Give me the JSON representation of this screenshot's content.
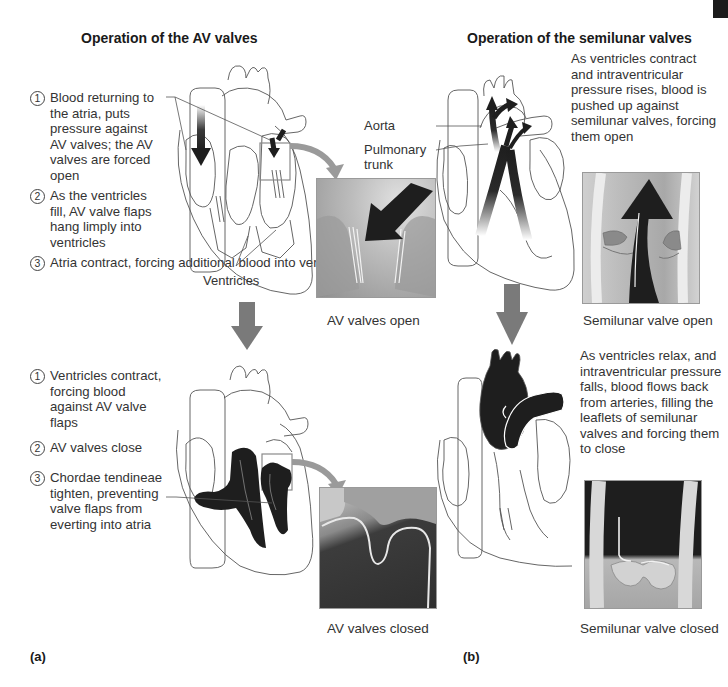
{
  "figure": {
    "corner_tab_color": "#1b1b1b",
    "arrow_color": "#7a7a7a",
    "blood_color": "#1e1e1e"
  },
  "panel_a": {
    "title": "Operation of the AV valves",
    "part_label": "(a)",
    "open_steps": [
      {
        "num": "1",
        "text": "Blood returning to the atria, puts pressure against AV valves; the AV valves are forced open"
      },
      {
        "num": "2",
        "text": "As the ventricles fill, AV valve flaps hang limply into ventricles"
      },
      {
        "num": "3",
        "text": "Atria contract, forcing additional blood into ventricles"
      }
    ],
    "ventricles_label": "Ventricles",
    "open_caption": "AV valves open",
    "closed_steps": [
      {
        "num": "1",
        "text": "Ventricles contract, forcing blood against AV valve flaps"
      },
      {
        "num": "2",
        "text": "AV valves close"
      },
      {
        "num": "3",
        "text": "Chordae tendineae tighten, preventing valve flaps from everting into atria"
      }
    ],
    "closed_caption": "AV valves closed"
  },
  "panel_b": {
    "title": "Operation of the semilunar valves",
    "part_label": "(b)",
    "open_text": "As ventricles contract and intraventricular pressure rises, blood is pushed up against semilunar valves, forcing them open",
    "aorta_label": "Aorta",
    "pulmonary_label": "Pulmonary trunk",
    "open_caption": "Semilunar valve open",
    "closed_text": "As ventricles relax, and intraventricular pressure falls, blood flows back from arteries, filling the leaflets of semilunar valves and forcing them to close",
    "closed_caption": "Semilunar valve closed"
  }
}
